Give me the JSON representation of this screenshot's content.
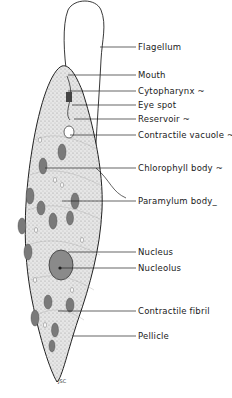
{
  "diagram": {
    "labels": [
      {
        "id": "flagellum",
        "text": "Flagellum",
        "y": 47
      },
      {
        "id": "mouth",
        "text": "Mouth",
        "y": 75
      },
      {
        "id": "cytopharynx",
        "text": "Cytopharynx ~",
        "y": 91
      },
      {
        "id": "eye-spot",
        "text": "Eye spot",
        "y": 105
      },
      {
        "id": "reservoir",
        "text": "Reservoir ~",
        "y": 119
      },
      {
        "id": "contractile-vacuole",
        "text": "Contractile vacuole ~",
        "y": 135
      },
      {
        "id": "chlorophyll-body",
        "text": "Chlorophyll body ~",
        "y": 168
      },
      {
        "id": "paramylum-body",
        "text": "Paramylum body_",
        "y": 201
      },
      {
        "id": "nucleus",
        "text": "Nucleus",
        "y": 252
      },
      {
        "id": "nucleolus",
        "text": "Nucleolus",
        "y": 268
      },
      {
        "id": "contractile-fibril",
        "text": "Contractile fibril",
        "y": 311
      },
      {
        "id": "pellicle",
        "text": "Pellicle",
        "y": 336
      }
    ],
    "signature": "JSC",
    "colors": {
      "line": "#222222",
      "stipple": "#bdbdbd",
      "body_fill": "#e4e4e4",
      "organelle": "#7a7a7a"
    }
  }
}
